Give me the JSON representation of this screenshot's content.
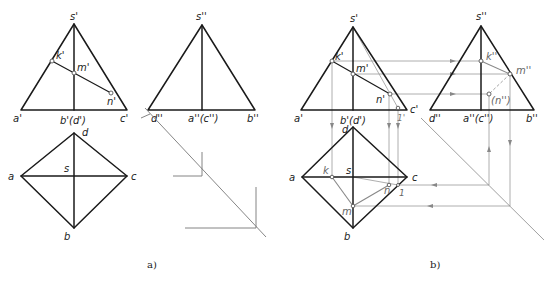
{
  "figure": {
    "panels": [
      {
        "caption": "a)",
        "front_view": {
          "labels": {
            "apex": "s'",
            "left": "a'",
            "right": "c'",
            "base_mid": "b'(d')",
            "k": "k'",
            "m": "m'",
            "n": "n'"
          }
        },
        "top_view": {
          "labels": {
            "top": "d",
            "left": "a",
            "right": "c",
            "bottom": "b",
            "center": "s"
          }
        },
        "side_view": {
          "labels": {
            "apex": "s''",
            "left": "d''",
            "right": "b''",
            "base_mid": "a''(c'')"
          }
        }
      },
      {
        "caption": "b)",
        "front_view": {
          "labels": {
            "apex": "s'",
            "left": "a'",
            "right": "c'",
            "base_mid": "b'(d')",
            "k": "k'",
            "m": "m'",
            "n": "n'",
            "one": "1'"
          }
        },
        "top_view": {
          "labels": {
            "top": "d",
            "left": "a",
            "right": "c",
            "bottom": "b",
            "center": "s",
            "k": "k",
            "m": "m",
            "n": "n",
            "one": "1"
          }
        },
        "side_view": {
          "labels": {
            "apex": "s''",
            "left": "d''",
            "right": "b''",
            "base_mid": "a''(c'')",
            "k": "k''",
            "m": "m''",
            "n": "(n'')"
          }
        }
      }
    ]
  },
  "colors": {
    "outline": "#1a1a1a",
    "construction": "#888888",
    "background": "#ffffff"
  }
}
